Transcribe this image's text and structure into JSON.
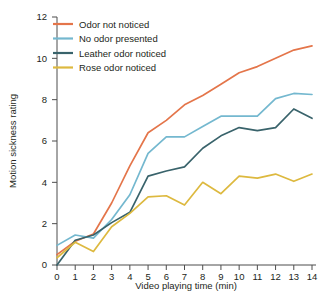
{
  "chart_data": {
    "type": "line",
    "title": "",
    "xlabel": "Video playing time (min)",
    "ylabel": "Motion sickness rating",
    "xlim": [
      0,
      14
    ],
    "ylim": [
      0,
      12
    ],
    "xticks": [
      0,
      1,
      2,
      3,
      4,
      5,
      6,
      7,
      8,
      9,
      10,
      11,
      12,
      13,
      14
    ],
    "yticks": [
      0,
      2,
      4,
      6,
      8,
      10,
      12
    ],
    "xtick_labels": [
      "0",
      "1",
      "2",
      "3",
      "4",
      "5",
      "6",
      "7",
      "8",
      "9",
      "10",
      "11",
      "12",
      "13",
      "14"
    ],
    "ytick_labels": [
      "0",
      "2",
      "4",
      "6",
      "8",
      "10",
      "12"
    ],
    "grid": false,
    "legend_position": "top-left",
    "x": [
      0,
      1,
      2,
      3,
      4,
      5,
      6,
      7,
      8,
      9,
      10,
      11,
      12,
      13,
      14
    ],
    "series": [
      {
        "name": "Odor not noticed",
        "color": "#e4754a",
        "values": [
          0.5,
          1.15,
          1.5,
          3.0,
          4.8,
          6.4,
          7.0,
          7.75,
          8.2,
          8.75,
          9.3,
          9.6,
          10.0,
          10.4,
          10.6
        ]
      },
      {
        "name": "No odor presented",
        "color": "#74b8cf",
        "values": [
          0.95,
          1.45,
          1.3,
          2.2,
          3.4,
          5.4,
          6.2,
          6.2,
          6.7,
          7.2,
          7.2,
          7.2,
          8.05,
          8.3,
          8.25
        ]
      },
      {
        "name": "Leather odor noticed",
        "color": "#39636b",
        "values": [
          0.0,
          1.2,
          1.45,
          2.05,
          2.55,
          4.3,
          4.55,
          4.75,
          5.65,
          6.25,
          6.65,
          6.5,
          6.65,
          7.55,
          7.1
        ]
      },
      {
        "name": "Rose odor noticed",
        "color": "#ddb93f",
        "values": [
          0.35,
          1.1,
          0.65,
          1.85,
          2.5,
          3.3,
          3.35,
          2.9,
          4.0,
          3.45,
          4.3,
          4.2,
          4.4,
          4.05,
          4.4
        ]
      }
    ]
  },
  "legend": {
    "items": [
      {
        "label": "Odor not noticed",
        "color": "#e4754a"
      },
      {
        "label": "No odor presented",
        "color": "#74b8cf"
      },
      {
        "label": "Leather odor noticed",
        "color": "#39636b"
      },
      {
        "label": "Rose odor noticed",
        "color": "#ddb93f"
      }
    ]
  },
  "axes": {
    "x_title": "Video playing time (min)",
    "y_title": "Motion sickness rating"
  }
}
